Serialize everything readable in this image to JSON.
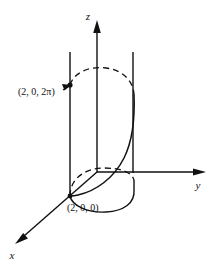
{
  "figure": {
    "background_color": "#ffffff",
    "stroke_color": "#111111",
    "axes": [
      {
        "name": "z",
        "label": "z",
        "label_x": 88,
        "label_y": 20,
        "direction": "up"
      },
      {
        "name": "y",
        "label": "y",
        "label_x": 198,
        "label_y": 189,
        "direction": "right"
      },
      {
        "name": "x",
        "label": "x",
        "label_x": 12,
        "label_y": 259,
        "direction": "down-left"
      }
    ],
    "points": [
      {
        "name": "top-point",
        "label": "(2, 0, 2π)",
        "label_x": 18,
        "label_y": 95,
        "marker_x": 70,
        "marker_y": 85
      },
      {
        "name": "bottom-point",
        "label": "(2, 0, 0)",
        "label_x": 67,
        "label_y": 211,
        "marker_x": 70,
        "marker_y": 196
      }
    ],
    "origin": {
      "x": 97,
      "y": 172
    },
    "cylinder": {
      "radius_label": "2",
      "left_generator_x": 70,
      "right_generator_x": 133,
      "top_y": 52,
      "bottom_y": 196
    },
    "helix": {
      "turns": "1",
      "parameter_range": "0 to 2π",
      "start_label": "(2, 0, 0)",
      "end_label": "(2, 0, 2π)"
    }
  }
}
